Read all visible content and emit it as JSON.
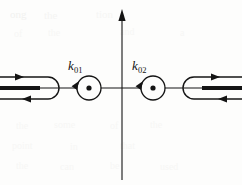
{
  "figure": {
    "kind": "complex-plane-contour-diagram",
    "width": 242,
    "height": 185,
    "background_color": "#fdfdfc",
    "ink_color": "#141414",
    "ghost_color": "#e9e9e6",
    "axes": {
      "imaginary_axis": {
        "name": "vertical-axis",
        "x": 122,
        "y_top": 10,
        "y_bottom": 180,
        "arrow_at": "top",
        "label": ""
      },
      "real_axis": {
        "name": "horizontal-axis",
        "y": 88,
        "x_left": 0,
        "x_right": 242,
        "arrow_at": "none",
        "label": ""
      },
      "origin": {
        "x": 122,
        "y": 88
      }
    },
    "poles": [
      {
        "id": "pole-k01",
        "label": "k",
        "subscript": "01",
        "label_x": 68,
        "label_y": 59,
        "center_x": 89,
        "center_y": 88,
        "radius": 12,
        "dot_radius": 2.6,
        "orientation": "clockwise",
        "arrow_angle_deg": 215
      },
      {
        "id": "pole-k02",
        "label": "k",
        "subscript": "02",
        "label_x": 132,
        "label_y": 59,
        "center_x": 153,
        "center_y": 88,
        "radius": 12,
        "dot_radius": 2.6,
        "orientation": "clockwise",
        "arrow_angle_deg": 215
      }
    ],
    "branch_cuts": [
      {
        "id": "branch-cut-left",
        "side": "left",
        "turn_x": 48,
        "turn_y": 88,
        "turn_radius": 11,
        "bar_x_start": 0,
        "bar_x_end": 40,
        "bar_y": 88,
        "bar_thickness": 4,
        "upper_y": 77,
        "lower_y": 99,
        "upper_arrow_direction": "right",
        "upper_arrow_x": 24,
        "lower_arrow_direction": "left",
        "lower_arrow_x": 22,
        "opening": "left"
      },
      {
        "id": "branch-cut-right",
        "side": "right",
        "turn_x": 194,
        "turn_y": 88,
        "turn_radius": 11,
        "bar_x_start": 202,
        "bar_x_end": 242,
        "bar_y": 88,
        "bar_thickness": 4,
        "upper_y": 77,
        "lower_y": 99,
        "upper_arrow_direction": "right",
        "upper_arrow_x": 220,
        "lower_arrow_direction": "left",
        "lower_arrow_x": 218,
        "opening": "right"
      }
    ],
    "ghost_text": [
      {
        "text": "ong",
        "x": 10,
        "y": 8,
        "size": 11,
        "opacity": 0.55
      },
      {
        "text": "the",
        "x": 44,
        "y": 9,
        "size": 11,
        "opacity": 0.4
      },
      {
        "text": "tion",
        "x": 96,
        "y": 8,
        "size": 11,
        "opacity": 0.35
      },
      {
        "text": "of",
        "x": 14,
        "y": 28,
        "size": 10,
        "opacity": 0.3
      },
      {
        "text": "the",
        "x": 48,
        "y": 27,
        "size": 10,
        "opacity": 0.3
      },
      {
        "text": "and",
        "x": 120,
        "y": 26,
        "size": 10,
        "opacity": 0.3
      },
      {
        "text": "a",
        "x": 180,
        "y": 27,
        "size": 10,
        "opacity": 0.3
      },
      {
        "text": "the",
        "x": 16,
        "y": 120,
        "size": 10,
        "opacity": 0.3
      },
      {
        "text": "some",
        "x": 54,
        "y": 119,
        "size": 10,
        "opacity": 0.3
      },
      {
        "text": "of",
        "x": 110,
        "y": 120,
        "size": 10,
        "opacity": 0.3
      },
      {
        "text": "the",
        "x": 150,
        "y": 119,
        "size": 10,
        "opacity": 0.3
      },
      {
        "text": "point",
        "x": 12,
        "y": 140,
        "size": 10,
        "opacity": 0.3
      },
      {
        "text": "in",
        "x": 70,
        "y": 141,
        "size": 10,
        "opacity": 0.3
      },
      {
        "text": "that",
        "x": 120,
        "y": 140,
        "size": 10,
        "opacity": 0.3
      },
      {
        "text": "the",
        "x": 16,
        "y": 160,
        "size": 10,
        "opacity": 0.3
      },
      {
        "text": "can",
        "x": 60,
        "y": 161,
        "size": 10,
        "opacity": 0.3
      },
      {
        "text": "be",
        "x": 110,
        "y": 160,
        "size": 10,
        "opacity": 0.3
      },
      {
        "text": "used",
        "x": 160,
        "y": 161,
        "size": 10,
        "opacity": 0.3
      }
    ]
  }
}
